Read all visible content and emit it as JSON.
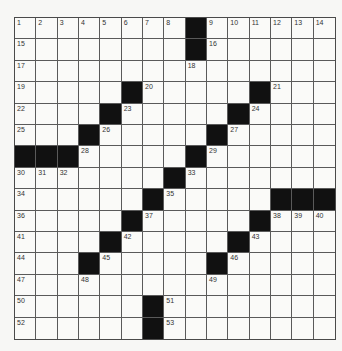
{
  "puzzle": {
    "rows": 15,
    "cols": 15,
    "colors": {
      "block": "#111111",
      "cell": "#fafaf8",
      "line": "#5a5a5a",
      "number": "#333333",
      "background": "#f7f7f5"
    },
    "blocks": [
      [
        0,
        8
      ],
      [
        1,
        8
      ],
      [
        3,
        5
      ],
      [
        3,
        11
      ],
      [
        4,
        4
      ],
      [
        4,
        10
      ],
      [
        5,
        3
      ],
      [
        5,
        9
      ],
      [
        6,
        0
      ],
      [
        6,
        1
      ],
      [
        6,
        2
      ],
      [
        6,
        8
      ],
      [
        7,
        7
      ],
      [
        8,
        6
      ],
      [
        8,
        12
      ],
      [
        8,
        13
      ],
      [
        8,
        14
      ],
      [
        9,
        5
      ],
      [
        9,
        11
      ],
      [
        10,
        4
      ],
      [
        10,
        10
      ],
      [
        11,
        3
      ],
      [
        11,
        9
      ],
      [
        13,
        6
      ],
      [
        14,
        6
      ]
    ],
    "numbers": [
      {
        "r": 0,
        "c": 0,
        "n": "1"
      },
      {
        "r": 0,
        "c": 1,
        "n": "2"
      },
      {
        "r": 0,
        "c": 2,
        "n": "3"
      },
      {
        "r": 0,
        "c": 3,
        "n": "4"
      },
      {
        "r": 0,
        "c": 4,
        "n": "5"
      },
      {
        "r": 0,
        "c": 5,
        "n": "6"
      },
      {
        "r": 0,
        "c": 6,
        "n": "7"
      },
      {
        "r": 0,
        "c": 7,
        "n": "8"
      },
      {
        "r": 0,
        "c": 9,
        "n": "9"
      },
      {
        "r": 0,
        "c": 10,
        "n": "10"
      },
      {
        "r": 0,
        "c": 11,
        "n": "11"
      },
      {
        "r": 0,
        "c": 12,
        "n": "12"
      },
      {
        "r": 0,
        "c": 13,
        "n": "13"
      },
      {
        "r": 0,
        "c": 14,
        "n": "14"
      },
      {
        "r": 1,
        "c": 0,
        "n": "15"
      },
      {
        "r": 1,
        "c": 9,
        "n": "16"
      },
      {
        "r": 2,
        "c": 0,
        "n": "17"
      },
      {
        "r": 2,
        "c": 8,
        "n": "18"
      },
      {
        "r": 3,
        "c": 0,
        "n": "19"
      },
      {
        "r": 3,
        "c": 6,
        "n": "20"
      },
      {
        "r": 3,
        "c": 12,
        "n": "21"
      },
      {
        "r": 4,
        "c": 0,
        "n": "22"
      },
      {
        "r": 4,
        "c": 5,
        "n": "23"
      },
      {
        "r": 4,
        "c": 11,
        "n": "24"
      },
      {
        "r": 5,
        "c": 0,
        "n": "25"
      },
      {
        "r": 5,
        "c": 4,
        "n": "26"
      },
      {
        "r": 5,
        "c": 10,
        "n": "27"
      },
      {
        "r": 6,
        "c": 3,
        "n": "28"
      },
      {
        "r": 6,
        "c": 9,
        "n": "29"
      },
      {
        "r": 7,
        "c": 0,
        "n": "30"
      },
      {
        "r": 7,
        "c": 1,
        "n": "31"
      },
      {
        "r": 7,
        "c": 2,
        "n": "32"
      },
      {
        "r": 7,
        "c": 8,
        "n": "33"
      },
      {
        "r": 8,
        "c": 0,
        "n": "34"
      },
      {
        "r": 8,
        "c": 7,
        "n": "35"
      },
      {
        "r": 9,
        "c": 0,
        "n": "36"
      },
      {
        "r": 9,
        "c": 6,
        "n": "37"
      },
      {
        "r": 9,
        "c": 12,
        "n": "38"
      },
      {
        "r": 9,
        "c": 13,
        "n": "39"
      },
      {
        "r": 9,
        "c": 14,
        "n": "40"
      },
      {
        "r": 10,
        "c": 0,
        "n": "41"
      },
      {
        "r": 10,
        "c": 5,
        "n": "42"
      },
      {
        "r": 10,
        "c": 11,
        "n": "43"
      },
      {
        "r": 11,
        "c": 0,
        "n": "44"
      },
      {
        "r": 11,
        "c": 4,
        "n": "45"
      },
      {
        "r": 11,
        "c": 10,
        "n": "46"
      },
      {
        "r": 12,
        "c": 0,
        "n": "47"
      },
      {
        "r": 12,
        "c": 3,
        "n": "48"
      },
      {
        "r": 12,
        "c": 9,
        "n": "49"
      },
      {
        "r": 13,
        "c": 0,
        "n": "50"
      },
      {
        "r": 13,
        "c": 7,
        "n": "51"
      },
      {
        "r": 14,
        "c": 0,
        "n": "52"
      },
      {
        "r": 14,
        "c": 7,
        "n": "53"
      }
    ],
    "entries": []
  }
}
